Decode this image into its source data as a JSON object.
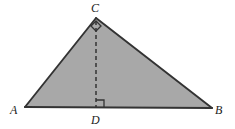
{
  "figure": {
    "kind": "geometry-diagram",
    "background_color": "#ffffff",
    "fill_color": "#a8a8a8",
    "stroke_color": "#333333",
    "dash_color": "#333333",
    "label_color": "#1c1c1c",
    "labels": {
      "a": "A",
      "b": "B",
      "c": "C",
      "d": "D"
    },
    "points": {
      "A": {
        "x": 25,
        "y": 107
      },
      "B": {
        "x": 212,
        "y": 108
      },
      "C": {
        "x": 96,
        "y": 18
      },
      "D": {
        "x": 96,
        "y": 108
      }
    },
    "segments": [
      {
        "name": "side-AC",
        "from": "A",
        "to": "C",
        "style": "solid"
      },
      {
        "name": "side-CB",
        "from": "C",
        "to": "B",
        "style": "solid"
      },
      {
        "name": "side-AB",
        "from": "A",
        "to": "B",
        "style": "solid"
      },
      {
        "name": "altitude-CD",
        "from": "C",
        "to": "D",
        "style": "dashed"
      }
    ],
    "angle_marks": [
      {
        "name": "right-angle-at-D",
        "at": "D",
        "type": "right-angle-square"
      },
      {
        "name": "right-angle-at-C",
        "at": "C",
        "type": "right-angle-diamond"
      }
    ],
    "dash_pattern": "4 3"
  }
}
